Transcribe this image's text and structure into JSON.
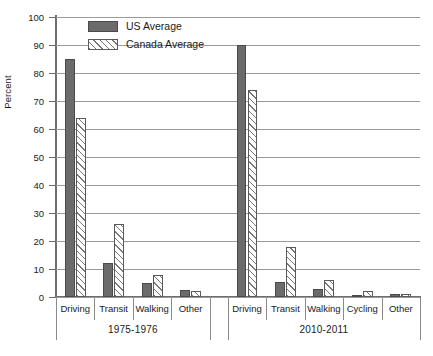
{
  "chart_data": {
    "type": "bar",
    "title": "",
    "xlabel": "",
    "ylabel": "Percent",
    "ylim": [
      0,
      100
    ],
    "ytick_step": 10,
    "yticks": [
      "0",
      "10",
      "20",
      "30",
      "40",
      "50",
      "60",
      "70",
      "80",
      "90",
      "100"
    ],
    "grid": true,
    "legend_position": "top-center",
    "groups": [
      {
        "label": "1975-1976",
        "categories": [
          "Driving",
          "Transit",
          "Walking",
          "Other"
        ],
        "series": [
          {
            "name": "US Average",
            "values": [
              85,
              12,
              5,
              2.5
            ]
          },
          {
            "name": "Canada Average",
            "values": [
              64,
              26,
              8,
              2
            ]
          }
        ]
      },
      {
        "label": "2010-2011",
        "categories": [
          "Driving",
          "Transit",
          "Walking",
          "Cycling",
          "Other"
        ],
        "series": [
          {
            "name": "US Average",
            "values": [
              90,
              5.5,
              3,
              0.7,
              1
            ]
          },
          {
            "name": "Canada Average",
            "values": [
              74,
              18,
              6,
              2,
              1
            ]
          }
        ]
      }
    ],
    "legend": [
      {
        "label": "US Average",
        "key": "us",
        "color": "#6b6b6b"
      },
      {
        "label": "Canada Average",
        "key": "ca",
        "color": "#ffffff"
      }
    ]
  }
}
